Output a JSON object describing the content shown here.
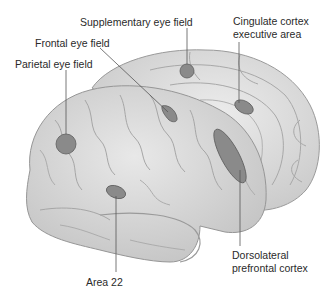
{
  "diagram": {
    "colors": {
      "background": "#ffffff",
      "brain_fill": "#dcdcdc",
      "brain_shade": "#c4c4c4",
      "sulcus_line": "#9a9a9a",
      "region_fill": "#8a8a8a",
      "region_stroke": "#5e5e5e",
      "leader_line": "#555555",
      "label_text": "#2a2a2a"
    },
    "labels": {
      "supplementary_eye_field": "Supplementary eye field",
      "cingulate_line1": "Cingulate cortex",
      "cingulate_line2": "executive area",
      "frontal_eye_field": "Frontal eye field",
      "parietal_eye_field": "Parietal eye field",
      "dlpfc_line1": "Dorsolateral",
      "dlpfc_line2": "prefrontal cortex",
      "area_22": "Area 22"
    },
    "regions": [
      {
        "id": "supplementary-eye-field",
        "shape": "circle"
      },
      {
        "id": "cingulate-cortex-executive-area",
        "shape": "ellipse"
      },
      {
        "id": "frontal-eye-field",
        "shape": "teardrop"
      },
      {
        "id": "parietal-eye-field",
        "shape": "circle"
      },
      {
        "id": "dorsolateral-prefrontal-cortex",
        "shape": "elongated-ellipse"
      },
      {
        "id": "area-22",
        "shape": "ellipse"
      }
    ]
  }
}
